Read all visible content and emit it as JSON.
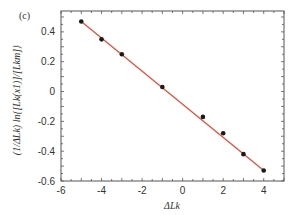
{
  "panel_label": "(c)",
  "chart_data": {
    "type": "scatter",
    "title": "",
    "xlabel": "ΔLk",
    "ylabel": "(1/ΔLk) ln{[Lk(x1)]/[Lkm]}",
    "xlim": [
      -6,
      5
    ],
    "ylim": [
      -0.6,
      0.54
    ],
    "x_ticks": [
      -6,
      -4,
      -2,
      0,
      2,
      4
    ],
    "y_ticks": [
      -0.6,
      -0.4,
      -0.2,
      0,
      0.2,
      0.4
    ],
    "x_tick_labels": [
      "-6",
      "-4",
      "-2",
      "0",
      "2",
      "4"
    ],
    "y_tick_labels": [
      "-0.6",
      "-0.4",
      "-0.2",
      "0",
      "0.2",
      "0.4"
    ],
    "grid": false,
    "legend": null,
    "series": [
      {
        "name": "data",
        "marker": "circle",
        "color": "#1a1a1a",
        "x": [
          -5,
          -4,
          -3,
          -1,
          1,
          2,
          3,
          4
        ],
        "y": [
          0.47,
          0.35,
          0.25,
          0.03,
          -0.17,
          -0.28,
          -0.42,
          -0.53
        ]
      },
      {
        "name": "linear fit",
        "type": "line",
        "color": "#e0503a",
        "x": [
          -5,
          4
        ],
        "y": [
          0.47,
          -0.53
        ]
      }
    ]
  }
}
